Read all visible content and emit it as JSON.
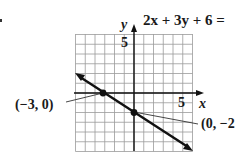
{
  "chart_data": {
    "type": "line",
    "equation": "2x + 3y + 6 =",
    "xlabel": "x",
    "ylabel": "y",
    "xlim": [
      -6,
      6
    ],
    "ylim": [
      -6,
      6
    ],
    "grid": true,
    "tick_labels": {
      "x": [
        "5"
      ],
      "y": [
        "5"
      ]
    },
    "series": [
      {
        "name": "2x + 3y + 6 = 0",
        "slope": -0.6667,
        "intercept": -2,
        "x": [
          -6,
          6
        ],
        "y": [
          2,
          -6
        ],
        "arrows": "both"
      }
    ],
    "points": [
      {
        "x": -3,
        "y": 0,
        "label": "(−3, 0)"
      },
      {
        "x": 0,
        "y": -2,
        "label": "(0, −2"
      }
    ],
    "annotations": [
      "(−3, 0)",
      "(0, −2"
    ]
  },
  "labels": {
    "equation": "2x + 3y + 6 =",
    "y_axis": "y",
    "x_axis": "x",
    "y_tick_5": "5",
    "x_tick_5": "5",
    "point_a": "(−3, 0)",
    "point_b": "(0, −2"
  }
}
